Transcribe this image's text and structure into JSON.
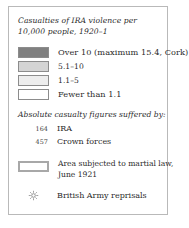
{
  "legend": {
    "title": {
      "line1": "Casualties of IRA violence per",
      "line2": "10,000 people,  1920–1"
    },
    "classes": [
      {
        "label": "Over 10 (maximum 15.4, Cork)",
        "color": "#808080"
      },
      {
        "label": "5.1–10",
        "color": "#d4d4d4"
      },
      {
        "label": "1.1–5",
        "color": "#ededed"
      },
      {
        "label": "Fewer than 1.1",
        "color": "#ffffff"
      }
    ],
    "figures_heading": "Absolute casualty figures suffered by:",
    "figures": [
      {
        "value": "164",
        "label": "IRA"
      },
      {
        "value": "457",
        "label": "Crown forces"
      }
    ],
    "martial_law": {
      "line1": "Area subjected to martial law,",
      "line2": "June 1921",
      "border_color": "#a8a8a8"
    },
    "reprisals": {
      "label": "British Army reprisals",
      "marker": "starburst-marker",
      "color": "#8a8a8a"
    }
  }
}
